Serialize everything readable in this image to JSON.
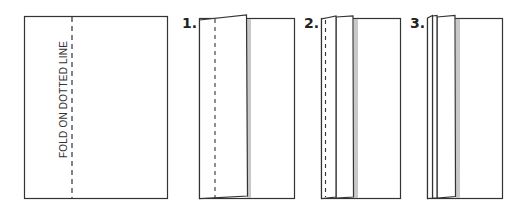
{
  "diagram": {
    "instruction_text": "FOLD ON DOTTED LINE",
    "steps": [
      {
        "label": "1."
      },
      {
        "label": "2."
      },
      {
        "label": "3."
      }
    ],
    "colors": {
      "line": "#333333",
      "shadow": "#c8c8c8",
      "paper": "#ffffff"
    }
  }
}
